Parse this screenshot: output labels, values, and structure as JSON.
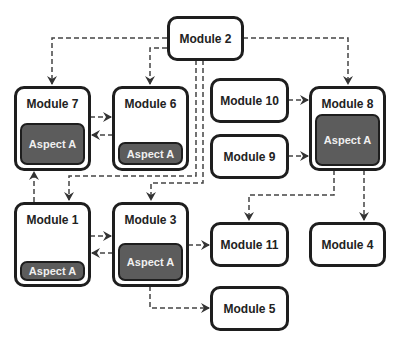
{
  "modules": {
    "m1": {
      "label": "Module 1",
      "aspect": "Aspect A"
    },
    "m2": {
      "label": "Module 2"
    },
    "m3": {
      "label": "Module 3",
      "aspect": "Aspect A"
    },
    "m4": {
      "label": "Module 4"
    },
    "m5": {
      "label": "Module 5"
    },
    "m6": {
      "label": "Module 6",
      "aspect": "Aspect A"
    },
    "m7": {
      "label": "Module 7",
      "aspect": "Aspect A"
    },
    "m8": {
      "label": "Module 8",
      "aspect": "Aspect A"
    },
    "m9": {
      "label": "Module 9"
    },
    "m10": {
      "label": "Module 10"
    },
    "m11": {
      "label": "Module 11"
    }
  },
  "edges": [
    {
      "from": "Module 2",
      "to": "Module 7",
      "style": "dashed"
    },
    {
      "from": "Module 2",
      "to": "Module 6",
      "style": "dashed"
    },
    {
      "from": "Module 2",
      "to": "Module 8",
      "style": "dashed"
    },
    {
      "from": "Module 2",
      "to": "Module 1",
      "style": "dashed"
    },
    {
      "from": "Module 2",
      "to": "Module 3",
      "style": "dashed"
    },
    {
      "from": "Module 7",
      "to": "Module 6",
      "style": "dashed"
    },
    {
      "from": "Module 6",
      "to": "Module 7",
      "style": "dashed"
    },
    {
      "from": "Module 10",
      "to": "Module 8",
      "style": "dashed"
    },
    {
      "from": "Module 9",
      "to": "Module 8",
      "style": "dashed"
    },
    {
      "from": "Module 1",
      "to": "Module 7",
      "style": "dashed"
    },
    {
      "from": "Module 1",
      "to": "Module 3",
      "style": "dashed"
    },
    {
      "from": "Module 3",
      "to": "Module 1",
      "style": "dashed"
    },
    {
      "from": "Module 3",
      "to": "Module 11",
      "style": "dashed"
    },
    {
      "from": "Module 3",
      "to": "Module 5",
      "style": "dashed"
    },
    {
      "from": "Module 8",
      "to": "Module 11",
      "style": "dashed"
    },
    {
      "from": "Module 8",
      "to": "Module 4",
      "style": "dashed"
    }
  ]
}
